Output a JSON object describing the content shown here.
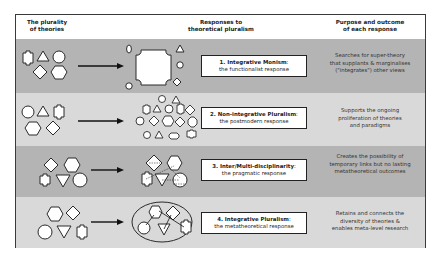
{
  "header": {
    "col1": [
      "The plurality",
      "of theories"
    ],
    "col2": [
      "Responses to",
      "theoretical pluralism"
    ],
    "col3": [
      "Purpose and outcome",
      "of each response"
    ]
  },
  "rows": [
    {
      "title": "1. Integrative Monism",
      "subtitle": "the functionalist response",
      "description": [
        "Searches for super-theory",
        "that supplants & marginalises",
        "(\"integrates\") other views"
      ],
      "shading": "#b4b4b4"
    },
    {
      "title": "2. Non-integrative Pluralism",
      "subtitle": "the postmodern response",
      "description": [
        "Supports the ongoing",
        "proliferation of theories",
        "and paradigms"
      ],
      "shading": "#d9d9d9"
    },
    {
      "title": "3. Inter/Multi-disciplinarity",
      "subtitle": "the pragmatic response",
      "description": [
        "Creates the possibility of",
        "temporary links but no lasting",
        "metatheoretical outcomes"
      ],
      "shading": "#b4b4b4"
    },
    {
      "title": "4. Integrative Pluralism",
      "subtitle": "the metatheoretical response",
      "description": [
        "Retains and connects the",
        "diversity of theories &",
        "enables meta-level research"
      ],
      "shading": "#d9d9d9"
    }
  ],
  "colors": {
    "stroke": "#2a2a2a",
    "fill": "#ffffff",
    "dark_row": "#b4b4b4",
    "light_row": "#d9d9d9"
  }
}
